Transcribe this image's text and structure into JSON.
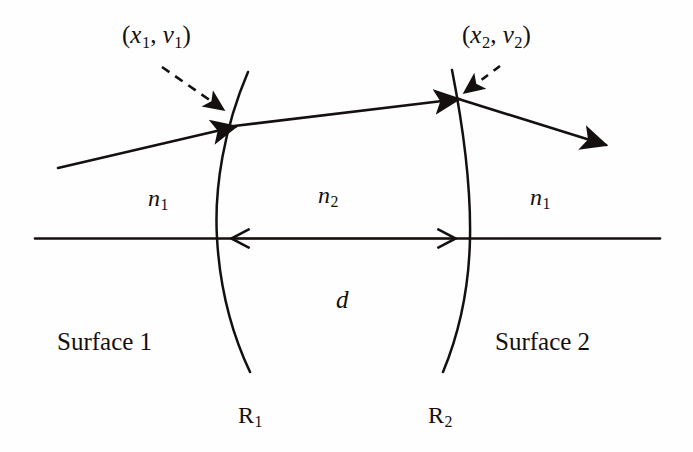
{
  "figure": {
    "ink_color": "#14100f",
    "background_color": "#fefefe"
  },
  "labels": {
    "coord1": {
      "open": "(",
      "x_sym": "x",
      "x_sub": "1",
      "comma": ", ",
      "v_sym": "v",
      "v_sub": "1",
      "close": ")"
    },
    "coord2": {
      "open": "(",
      "x_sym": "x",
      "x_sub": "2",
      "comma": ", ",
      "v_sym": "v",
      "v_sub": "2",
      "close": ")"
    },
    "n_left": {
      "sym": "n",
      "sub": "1"
    },
    "n_middle": {
      "sym": "n",
      "sub": "2"
    },
    "n_right": {
      "sym": "n",
      "sub": "1"
    },
    "thickness": {
      "sym": "d"
    },
    "surface1": "Surface 1",
    "surface2": "Surface 2",
    "radius1": {
      "sym": "R",
      "sub": "1"
    },
    "radius2": {
      "sym": "R",
      "sub": "2"
    }
  },
  "geometry": {
    "optical_axis": {
      "y": 238,
      "x_start": 35,
      "x_end": 660
    },
    "surface1": {
      "vertex_x": 217,
      "top": [
        248,
        72
      ],
      "bottom": [
        250,
        372
      ],
      "curvature": "convex-left"
    },
    "surface2": {
      "vertex_x": 470,
      "top": [
        452,
        70
      ],
      "bottom": [
        443,
        372
      ],
      "curvature": "convex-right"
    },
    "incident_ray": {
      "from": [
        58,
        168
      ],
      "to": [
        236,
        126
      ]
    },
    "internal_ray": {
      "from": [
        236,
        126
      ],
      "to": [
        458,
        99
      ]
    },
    "exit_ray": {
      "from": [
        458,
        99
      ],
      "to": [
        608,
        146
      ]
    },
    "dimension_d": {
      "left_x": 217,
      "right_x": 470,
      "y": 238
    }
  }
}
